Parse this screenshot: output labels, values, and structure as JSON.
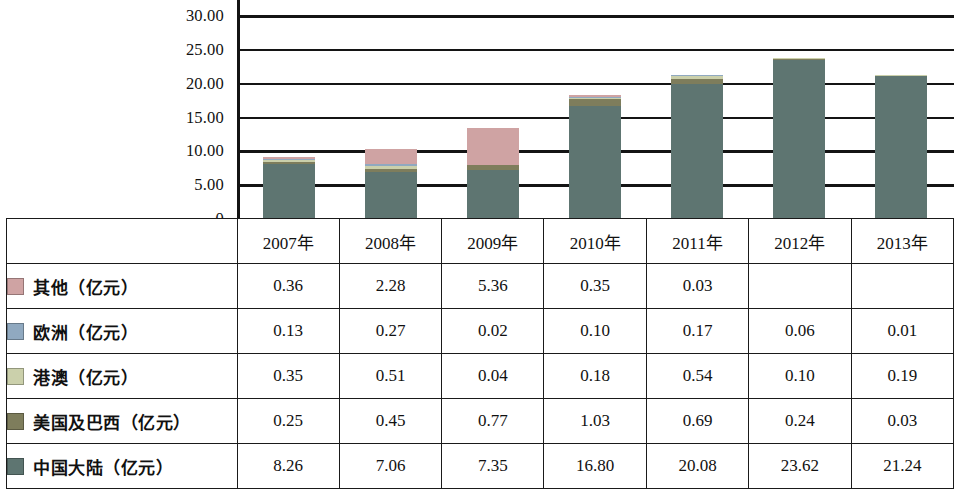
{
  "chart_data": {
    "type": "bar",
    "subtype": "stacked",
    "title": "",
    "xlabel": "",
    "ylabel": "",
    "grid": true,
    "legend_position": "table-left",
    "ylim": [
      0,
      30
    ],
    "yticks": [
      "0",
      "5.00",
      "10.00",
      "15.00",
      "20.00",
      "25.00",
      "30.00"
    ],
    "ytick_values": [
      0,
      5,
      10,
      15,
      20,
      25,
      30
    ],
    "categories": [
      "2007年",
      "2008年",
      "2009年",
      "2010年",
      "2011年",
      "2012年",
      "2013年"
    ],
    "series": [
      {
        "name": "中国大陆（亿元）",
        "color": "#5e7571",
        "values": [
          8.26,
          7.06,
          7.35,
          16.8,
          20.08,
          23.62,
          21.24
        ],
        "display": [
          "8.26",
          "7.06",
          "7.35",
          "16.80",
          "20.08",
          "23.62",
          "21.24"
        ]
      },
      {
        "name": "美国及巴西（亿元）",
        "color": "#7e7d5c",
        "values": [
          0.25,
          0.45,
          0.77,
          1.03,
          0.69,
          0.24,
          0.03
        ],
        "display": [
          "0.25",
          "0.45",
          "0.77",
          "1.03",
          "0.69",
          "0.24",
          "0.03"
        ]
      },
      {
        "name": "港澳（亿元）",
        "color": "#cbd0ab",
        "values": [
          0.35,
          0.51,
          0.04,
          0.18,
          0.54,
          0.1,
          0.19
        ],
        "display": [
          "0.35",
          "0.51",
          "0.04",
          "0.18",
          "0.54",
          "0.10",
          "0.19"
        ]
      },
      {
        "name": "欧洲（亿元）",
        "color": "#90a9c0",
        "values": [
          0.13,
          0.27,
          0.02,
          0.1,
          0.17,
          0.06,
          0.01
        ],
        "display": [
          "0.13",
          "0.27",
          "0.02",
          "0.10",
          "0.17",
          "0.06",
          "0.01"
        ]
      },
      {
        "name": "其他（亿元）",
        "color": "#cfa3a3",
        "values": [
          0.36,
          2.28,
          5.36,
          0.35,
          0.03,
          null,
          null
        ],
        "display": [
          "0.36",
          "2.28",
          "5.36",
          "0.35",
          "0.03",
          "",
          ""
        ]
      }
    ],
    "totals": [
      9.35,
      10.57,
      13.54,
      18.46,
      21.51,
      24.02,
      21.47
    ]
  },
  "table": {
    "corner_label": "",
    "year_headers": [
      "2007年",
      "2008年",
      "2009年",
      "2010年",
      "2011年",
      "2012年",
      "2013年"
    ],
    "rows": [
      {
        "label": "其他（亿元）",
        "color": "#cfa3a3",
        "values": [
          "0.36",
          "2.28",
          "5.36",
          "0.35",
          "0.03",
          "",
          ""
        ]
      },
      {
        "label": "欧洲（亿元）",
        "color": "#90a9c0",
        "values": [
          "0.13",
          "0.27",
          "0.02",
          "0.10",
          "0.17",
          "0.06",
          "0.01"
        ]
      },
      {
        "label": "港澳（亿元）",
        "color": "#cbd0ab",
        "values": [
          "0.35",
          "0.51",
          "0.04",
          "0.18",
          "0.54",
          "0.10",
          "0.19"
        ]
      },
      {
        "label": "美国及巴西（亿元）",
        "color": "#7e7d5c",
        "values": [
          "0.25",
          "0.45",
          "0.77",
          "1.03",
          "0.69",
          "0.24",
          "0.03"
        ]
      },
      {
        "label": "中国大陆（亿元）",
        "color": "#5e7571",
        "values": [
          "8.26",
          "7.06",
          "7.35",
          "16.80",
          "20.08",
          "23.62",
          "21.24"
        ]
      }
    ]
  },
  "style": {
    "axis_color": "#141414",
    "grid_color": "#141414",
    "border_color": "#1a1a1a",
    "background": "#ffffff"
  }
}
